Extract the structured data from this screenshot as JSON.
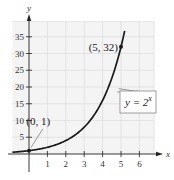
{
  "chart_data": {
    "type": "line",
    "title": "",
    "xlabel": "x",
    "ylabel": "y",
    "xlim": [
      -1,
      6.5
    ],
    "ylim": [
      0,
      38
    ],
    "grid": true,
    "x_ticks": [
      1,
      2,
      3,
      4,
      5,
      6
    ],
    "y_ticks": [
      5,
      10,
      15,
      20,
      25,
      30,
      35
    ],
    "series": [
      {
        "name": "y = 2^x",
        "function": "2^x",
        "x": [
          -1,
          0,
          1,
          2,
          3,
          4,
          5,
          5.2
        ],
        "values": [
          0.5,
          1,
          2,
          4,
          8,
          16,
          32,
          36.8
        ]
      }
    ],
    "annotations": [
      {
        "text": "(0, 1)",
        "x": 0,
        "y": 1
      },
      {
        "text": "(5, 32)",
        "x": 5,
        "y": 32
      }
    ],
    "equation_label": {
      "base": "y = 2",
      "exponent": "x"
    },
    "colors": {
      "curve": "#1a1a1a",
      "grid": "#d8d8d8",
      "grid_bg": "#f4f4f4",
      "axis": "#222222"
    }
  }
}
